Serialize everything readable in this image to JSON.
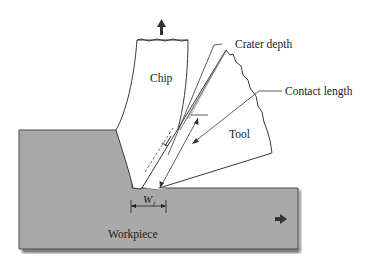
{
  "figure": {
    "type": "orthogonal metal cutting schematic",
    "labels": {
      "chip": "Chip",
      "crater_depth": "Crater depth",
      "contact_length": "Contact length",
      "tool": "Tool",
      "workpiece": "Workpiece",
      "flank_wear_symbol": "W",
      "flank_wear_subscript": "f"
    },
    "arrows": {
      "chip_flow": "up-arrow",
      "workpiece_motion": "right-arrow"
    },
    "colors": {
      "workpiece_fill": "#a9a9a9",
      "workpiece_shadow": "#6e6e6e",
      "outline": "#3a3a3a",
      "background": "#ffffff",
      "tool_fill": "#ffffff",
      "chip_fill": "#ffffff"
    }
  }
}
